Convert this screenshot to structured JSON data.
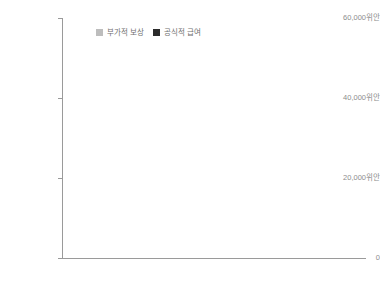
{
  "legend": {
    "position": "top-left-inside",
    "items": [
      {
        "label": "부가적 보상",
        "color": "#bdbdbd",
        "key": "supplementary"
      },
      {
        "label": "공식적 급여",
        "color": "#2b2b2b",
        "key": "official"
      }
    ]
  },
  "axes": {
    "y_ticks": [
      "0",
      "20,000위안",
      "40,000위안",
      "60,000위안"
    ],
    "y_tick_values": [
      0,
      20000,
      40000,
      60000
    ],
    "x_ticks": [
      "1979",
      "1985",
      "1991",
      "1997",
      "2003"
    ],
    "x_tick_values": [
      1979,
      1985,
      1991,
      1997,
      2003
    ]
  },
  "chart_data": {
    "type": "bar",
    "title": "",
    "subtitle": "",
    "xlabel": "",
    "ylabel": "",
    "stacked": true,
    "grid": false,
    "legend_position": "top-left-inside",
    "ylim": [
      0,
      60000
    ],
    "ytick_labels": [
      "0",
      "20,000위안",
      "40,000위안",
      "60,000위안"
    ],
    "ytick_values": [
      0,
      20000,
      40000,
      60000
    ],
    "xtick_labels": [
      "1979",
      "1985",
      "1991",
      "1997",
      "2003"
    ],
    "categories": [
      1978,
      1979,
      1980,
      1981,
      1982,
      1983,
      1984,
      1985,
      1986,
      1987,
      1988,
      1989,
      1990,
      1991,
      1992,
      1993,
      1994,
      1995,
      1996,
      1997,
      1998,
      1999,
      2000,
      2001,
      2002,
      2003,
      2004
    ],
    "series": [
      {
        "name": "공식적 급여",
        "color": "#2b2b2b",
        "values": [
          380,
          390,
          420,
          450,
          480,
          520,
          560,
          620,
          680,
          760,
          900,
          1000,
          1100,
          1250,
          1500,
          1900,
          2200,
          2600,
          3000,
          3400,
          3900,
          4500,
          5200,
          6000,
          6900,
          7800,
          8300
        ]
      },
      {
        "name": "부가적 보상",
        "color": "#bdbdbd",
        "values": [
          320,
          340,
          380,
          420,
          460,
          520,
          580,
          700,
          820,
          1000,
          1300,
          1600,
          2000,
          2500,
          3400,
          4600,
          6000,
          7800,
          9600,
          11800,
          13500,
          16500,
          19400,
          22000,
          27000,
          37500,
          45700
        ]
      }
    ],
    "totals": [
      700,
      730,
      800,
      870,
      940,
      1040,
      1140,
      1320,
      1500,
      1760,
      2200,
      2600,
      3100,
      3750,
      4900,
      6500,
      8200,
      10400,
      12600,
      15200,
      17400,
      21000,
      24600,
      28000,
      33900,
      45300,
      54000
    ]
  }
}
